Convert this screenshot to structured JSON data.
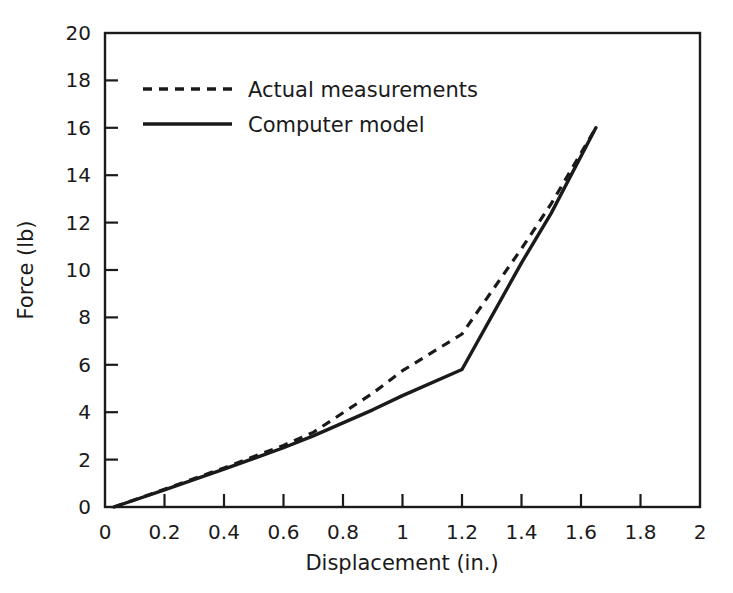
{
  "chart_data": {
    "type": "line",
    "title": "",
    "xlabel": "Displacement (in.)",
    "ylabel": "Force (lb)",
    "xlim": [
      0,
      2
    ],
    "ylim": [
      0,
      20
    ],
    "xticks": [
      0,
      0.2,
      0.4,
      0.6,
      0.8,
      1,
      1.2,
      1.4,
      1.6,
      1.8,
      2
    ],
    "xtick_labels": [
      "0",
      "0.2",
      "0.4",
      "0.6",
      "0.8",
      "1",
      "1.2",
      "1.4",
      "1.6",
      "1.8",
      "2"
    ],
    "yticks": [
      0,
      2,
      4,
      6,
      8,
      10,
      12,
      14,
      16,
      18,
      20
    ],
    "ytick_labels": [
      "0",
      "2",
      "4",
      "6",
      "8",
      "10",
      "12",
      "14",
      "16",
      "18",
      "20"
    ],
    "grid": false,
    "frame": "box",
    "tick_direction": "in",
    "legend_position": "upper left",
    "line_color": "#1a1a1a",
    "background_color": "#ffffff",
    "series": [
      {
        "name": "Actual measurements",
        "style": "dashed",
        "x": [
          0.03,
          0.2,
          0.4,
          0.6,
          0.7,
          0.9,
          1.0,
          1.2,
          1.4,
          1.5,
          1.65
        ],
        "y": [
          0.0,
          0.75,
          1.65,
          2.6,
          3.15,
          4.8,
          5.75,
          7.3,
          10.9,
          12.8,
          16.0
        ]
      },
      {
        "name": "Computer model",
        "style": "solid",
        "x": [
          0.03,
          0.2,
          0.4,
          0.6,
          0.7,
          0.9,
          1.0,
          1.2,
          1.4,
          1.5,
          1.65
        ],
        "y": [
          0.0,
          0.72,
          1.6,
          2.5,
          3.0,
          4.1,
          4.7,
          5.8,
          10.3,
          12.4,
          16.0
        ]
      }
    ]
  },
  "legend": {
    "entries": [
      {
        "label": "Actual measurements",
        "style": "dashed"
      },
      {
        "label": "Computer model",
        "style": "solid"
      }
    ]
  }
}
